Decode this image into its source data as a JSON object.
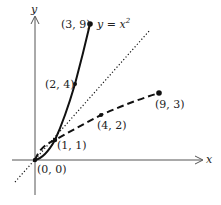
{
  "diagram": {
    "axes": {
      "x_label": "x",
      "y_label": "y"
    },
    "curve_label": {
      "lhs": "y = x",
      "exponent": "2"
    },
    "points": [
      {
        "id": "origin",
        "label": "(0, 0)",
        "x": 0,
        "y": 0
      },
      {
        "id": "p11",
        "label": "(1, 1)",
        "x": 1,
        "y": 1
      },
      {
        "id": "p24",
        "label": "(2, 4)",
        "x": 2,
        "y": 4
      },
      {
        "id": "p39",
        "label": "(3, 9)",
        "x": 3,
        "y": 9
      },
      {
        "id": "p42",
        "label": "(4, 2)",
        "x": 4,
        "y": 2
      },
      {
        "id": "p93",
        "label": "(9, 3)",
        "x": 9,
        "y": 3
      }
    ],
    "curves": [
      {
        "name": "y = x^2",
        "style": "solid",
        "color": "#111111"
      },
      {
        "name": "y = sqrt(x)",
        "style": "dashed",
        "color": "#111111"
      },
      {
        "name": "y = x",
        "style": "dotted",
        "color": "#111111"
      }
    ]
  }
}
